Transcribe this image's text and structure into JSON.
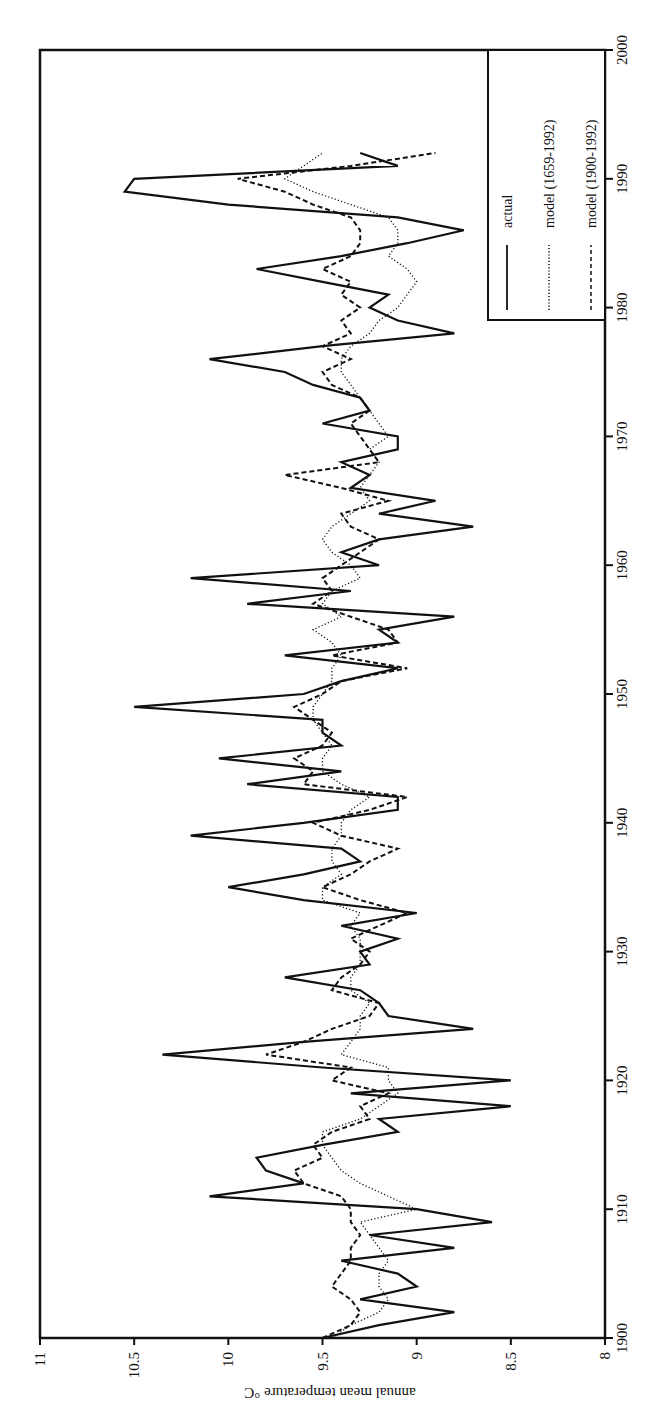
{
  "chart_data": {
    "type": "line",
    "orientation_note": "figure printed rotated 90 degrees",
    "title": "",
    "xlabel": "",
    "ylabel": "annual mean temperature °C",
    "xlim": [
      1900,
      2000
    ],
    "ylim": [
      8,
      11
    ],
    "xticks": [
      "1900",
      "1910",
      "1920",
      "1930",
      "1940",
      "1950",
      "1960",
      "1970",
      "1980",
      "1990",
      "2000"
    ],
    "yticks": [
      "8",
      "8.5",
      "9",
      "9.5",
      "10",
      "10.5",
      "11"
    ],
    "grid": false,
    "legend_position": "top-right",
    "x": [
      1900,
      1901,
      1902,
      1903,
      1904,
      1905,
      1906,
      1907,
      1908,
      1909,
      1910,
      1911,
      1912,
      1913,
      1914,
      1915,
      1916,
      1917,
      1918,
      1919,
      1920,
      1921,
      1922,
      1923,
      1924,
      1925,
      1926,
      1927,
      1928,
      1929,
      1930,
      1931,
      1932,
      1933,
      1934,
      1935,
      1936,
      1937,
      1938,
      1939,
      1940,
      1941,
      1942,
      1943,
      1944,
      1945,
      1946,
      1947,
      1948,
      1949,
      1950,
      1951,
      1952,
      1953,
      1954,
      1955,
      1956,
      1957,
      1958,
      1959,
      1960,
      1961,
      1962,
      1963,
      1964,
      1965,
      1966,
      1967,
      1968,
      1969,
      1970,
      1971,
      1972,
      1973,
      1974,
      1975,
      1976,
      1977,
      1978,
      1979,
      1980,
      1981,
      1982,
      1983,
      1984,
      1985,
      1986,
      1987,
      1988,
      1989,
      1990,
      1991,
      1992
    ],
    "series": [
      {
        "name": "actual",
        "style": "solid",
        "values": [
          9.5,
          9.2,
          8.8,
          9.3,
          9.0,
          9.1,
          9.4,
          8.8,
          9.25,
          8.6,
          9.0,
          10.1,
          9.6,
          9.8,
          9.85,
          9.5,
          9.1,
          9.2,
          8.5,
          9.35,
          8.5,
          9.5,
          10.35,
          9.6,
          8.7,
          9.15,
          9.2,
          9.3,
          9.7,
          9.25,
          9.3,
          9.1,
          9.4,
          9.0,
          9.6,
          10.0,
          9.6,
          9.3,
          9.4,
          10.2,
          9.6,
          9.1,
          9.1,
          9.9,
          9.4,
          10.05,
          9.4,
          9.5,
          9.5,
          10.5,
          9.6,
          9.4,
          9.1,
          9.7,
          9.1,
          9.2,
          8.8,
          9.9,
          9.35,
          10.2,
          9.2,
          9.4,
          9.2,
          8.7,
          9.2,
          8.9,
          9.35,
          9.25,
          9.4,
          9.1,
          9.1,
          9.5,
          9.25,
          9.3,
          9.55,
          9.7,
          10.1,
          9.5,
          8.8,
          9.1,
          9.25,
          9.15,
          9.5,
          9.85,
          9.4,
          9.05,
          8.75,
          9.1,
          10.0,
          10.55,
          10.5,
          9.1,
          9.3
        ]
      },
      {
        "name": "model (1659-1992)",
        "style": "dotted",
        "values": [
          9.45,
          9.35,
          9.2,
          9.15,
          9.2,
          9.2,
          9.15,
          9.2,
          9.25,
          9.3,
          9.0,
          9.15,
          9.3,
          9.4,
          9.45,
          9.5,
          9.5,
          9.3,
          9.2,
          9.1,
          9.15,
          9.15,
          9.4,
          9.35,
          9.3,
          9.3,
          9.25,
          9.35,
          9.35,
          9.3,
          9.3,
          9.3,
          9.35,
          9.3,
          9.5,
          9.5,
          9.4,
          9.45,
          9.45,
          9.4,
          9.4,
          9.35,
          9.25,
          9.4,
          9.5,
          9.5,
          9.45,
          9.5,
          9.55,
          9.55,
          9.5,
          9.45,
          9.45,
          9.4,
          9.45,
          9.55,
          9.4,
          9.5,
          9.45,
          9.3,
          9.35,
          9.45,
          9.5,
          9.45,
          9.35,
          9.25,
          9.3,
          9.25,
          9.2,
          9.25,
          9.15,
          9.2,
          9.25,
          9.3,
          9.35,
          9.4,
          9.4,
          9.35,
          9.25,
          9.2,
          9.1,
          9.05,
          9.0,
          9.05,
          9.15,
          9.1,
          9.1,
          9.15,
          9.35,
          9.55,
          9.7,
          9.6,
          9.5
        ]
      },
      {
        "name": "model (1900-1992)",
        "style": "dashed",
        "values": [
          9.5,
          9.35,
          9.3,
          9.35,
          9.45,
          9.4,
          9.35,
          9.35,
          9.3,
          9.35,
          9.35,
          9.4,
          9.6,
          9.65,
          9.5,
          9.55,
          9.45,
          9.25,
          9.3,
          9.15,
          9.45,
          9.35,
          9.8,
          9.6,
          9.45,
          9.25,
          9.2,
          9.45,
          9.4,
          9.3,
          9.25,
          9.35,
          9.2,
          9.05,
          9.3,
          9.5,
          9.35,
          9.25,
          9.1,
          9.4,
          9.55,
          9.25,
          9.05,
          9.6,
          9.55,
          9.65,
          9.5,
          9.45,
          9.55,
          9.65,
          9.5,
          9.4,
          9.05,
          9.45,
          9.1,
          9.15,
          9.35,
          9.55,
          9.45,
          9.5,
          9.4,
          9.3,
          9.2,
          9.35,
          9.4,
          9.15,
          9.4,
          9.7,
          9.2,
          9.25,
          9.3,
          9.35,
          9.25,
          9.3,
          9.45,
          9.5,
          9.35,
          9.5,
          9.35,
          9.4,
          9.3,
          9.4,
          9.35,
          9.5,
          9.35,
          9.3,
          9.3,
          9.35,
          9.55,
          9.7,
          9.95,
          9.35,
          8.9
        ]
      }
    ]
  },
  "legend": {
    "items": [
      {
        "label": "actual",
        "style": "solid"
      },
      {
        "label": "model  (1659-1992)",
        "style": "dotted"
      },
      {
        "label": "model  (1900-1992)",
        "style": "dashed"
      }
    ]
  },
  "axis": {
    "ylabel": "annual mean temperature °C"
  }
}
